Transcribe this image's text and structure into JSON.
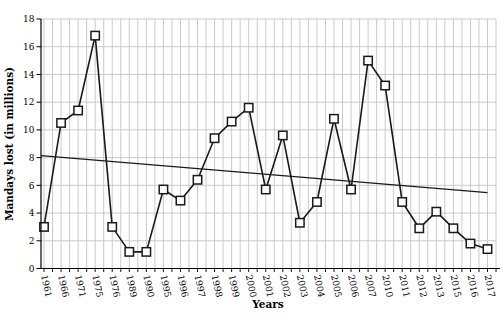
{
  "chart_data": {
    "type": "line",
    "title": "",
    "xlabel": "Years",
    "ylabel": "Mandays lost (in millions)",
    "categories": [
      "1961",
      "1966",
      "1971",
      "1975",
      "1976",
      "1989",
      "1990",
      "1995",
      "1996",
      "1997",
      "1998",
      "1999",
      "2000",
      "2001",
      "2002",
      "2003",
      "2004",
      "2005",
      "2006",
      "2007",
      "2010",
      "2011",
      "2012",
      "2013",
      "2015",
      "2016",
      "2017"
    ],
    "series": [
      {
        "name": "Mandays lost (in millions)",
        "values": [
          3.0,
          10.5,
          11.4,
          16.8,
          3.0,
          1.2,
          1.2,
          5.7,
          4.9,
          6.4,
          9.4,
          10.6,
          11.6,
          5.7,
          9.6,
          3.3,
          4.8,
          10.8,
          5.7,
          15.0,
          13.2,
          4.8,
          2.9,
          4.1,
          2.9,
          1.8,
          1.4
        ]
      }
    ],
    "trendline": {
      "type": "linear",
      "start_value": 8.15,
      "end_value": 5.47
    },
    "ylim": [
      0,
      18
    ],
    "ytick_interval": 2,
    "ytick_labels": [
      "0",
      "2",
      "4",
      "6",
      "8",
      "10",
      "12",
      "14",
      "16",
      "18"
    ],
    "marker": "square",
    "legend": "none",
    "grid": {
      "horizontal": "major (every 2 units)",
      "vertical": "minor (between every category)"
    },
    "colors": {
      "series_line": "#1a1a1a",
      "marker_fill": "#ffffff",
      "marker_stroke": "#1a1a1a",
      "trendline": "#1a1a1a",
      "gridline": "#c4c4c4",
      "axis": "#000000",
      "text": "#000000",
      "background": "#ffffff"
    }
  }
}
